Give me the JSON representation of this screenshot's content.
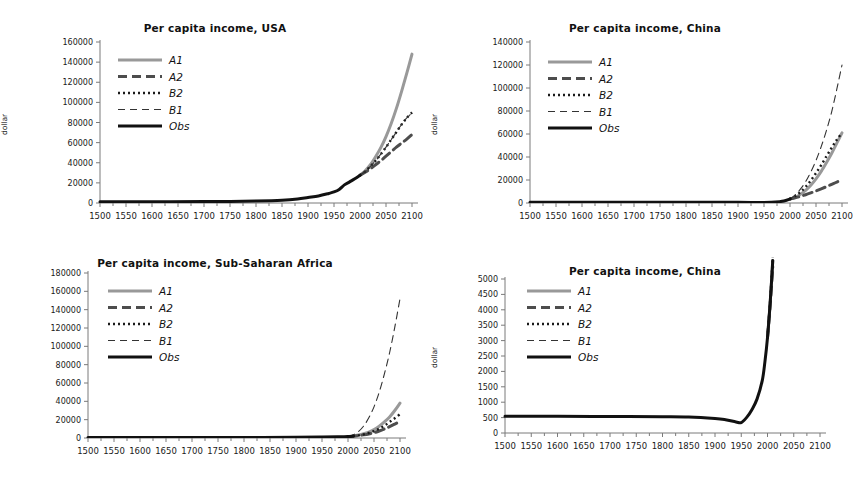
{
  "figure": {
    "panel_count": 4,
    "background_color": "#ffffff",
    "series_colors": {
      "A1": "#999999",
      "A2": "#4d4d4d",
      "B2": "#1a1a1a",
      "B1": "#333333",
      "Obs": "#111111"
    }
  },
  "charts": [
    {
      "id": "usa",
      "title": "Per capita income, USA",
      "ylabel": "dollar",
      "xlabel": "",
      "type": "line",
      "xlim": [
        1500,
        2100
      ],
      "ylim": [
        0,
        160000
      ],
      "xticks": [
        1500,
        1550,
        1600,
        1650,
        1700,
        1750,
        1800,
        1850,
        1900,
        1950,
        2000,
        2050,
        2100
      ],
      "yticks": [
        0,
        20000,
        40000,
        60000,
        80000,
        100000,
        120000,
        140000,
        160000
      ],
      "legend_position": "upper-left",
      "legend": [
        "A1",
        "A2",
        "B2",
        "B1",
        "Obs"
      ],
      "series": [
        {
          "name": "Obs",
          "style": "solid-thick",
          "color": "#111111",
          "x": [
            1500,
            1600,
            1700,
            1750,
            1800,
            1850,
            1880,
            1900,
            1920,
            1940,
            1950,
            1960,
            1970,
            1980,
            1990,
            2000
          ],
          "y": [
            1200,
            1300,
            1400,
            1600,
            2000,
            2800,
            4000,
            5500,
            7000,
            9500,
            11000,
            13500,
            18000,
            21000,
            24000,
            27500
          ]
        },
        {
          "name": "A1",
          "style": "solid-thick-gray",
          "color": "#999999",
          "x": [
            2000,
            2010,
            2020,
            2030,
            2040,
            2050,
            2060,
            2070,
            2080,
            2090,
            2100
          ],
          "y": [
            27500,
            32000,
            38000,
            46000,
            55000,
            66000,
            79000,
            94000,
            111000,
            129000,
            148000
          ]
        },
        {
          "name": "A2",
          "style": "dashed-thick",
          "color": "#4d4d4d",
          "x": [
            2000,
            2010,
            2020,
            2030,
            2040,
            2050,
            2060,
            2070,
            2080,
            2090,
            2100
          ],
          "y": [
            27500,
            30500,
            34000,
            38000,
            42000,
            46500,
            51000,
            55500,
            59500,
            63500,
            68000
          ]
        },
        {
          "name": "B2",
          "style": "dotted",
          "color": "#1a1a1a",
          "x": [
            2000,
            2010,
            2020,
            2030,
            2040,
            2050,
            2060,
            2070,
            2080,
            2090,
            2100
          ],
          "y": [
            27500,
            31500,
            36500,
            42000,
            48500,
            55500,
            63000,
            70500,
            78000,
            84500,
            90000
          ]
        },
        {
          "name": "B1",
          "style": "dashed-thin",
          "color": "#333333",
          "x": [
            2000,
            2010,
            2020,
            2030,
            2040,
            2050,
            2060,
            2070,
            2080,
            2090,
            2100
          ],
          "y": [
            27500,
            31500,
            36500,
            42000,
            48500,
            55500,
            63000,
            70500,
            78000,
            84500,
            89500
          ]
        }
      ]
    },
    {
      "id": "china-top",
      "title": "Per capita income, China",
      "ylabel": "dollar",
      "xlabel": "",
      "type": "line",
      "xlim": [
        1500,
        2100
      ],
      "ylim": [
        0,
        140000
      ],
      "xticks": [
        1500,
        1550,
        1600,
        1650,
        1700,
        1750,
        1800,
        1850,
        1900,
        1950,
        2000,
        2050,
        2100
      ],
      "yticks": [
        0,
        20000,
        40000,
        60000,
        80000,
        100000,
        120000,
        140000
      ],
      "legend_position": "upper-left",
      "legend": [
        "A1",
        "A2",
        "B2",
        "B1",
        "Obs"
      ],
      "series": [
        {
          "name": "Obs",
          "style": "solid-thick",
          "color": "#111111",
          "x": [
            1500,
            1600,
            1700,
            1800,
            1900,
            1950,
            1980,
            1990,
            2000
          ],
          "y": [
            600,
            600,
            600,
            600,
            550,
            450,
            1200,
            2000,
            3500
          ]
        },
        {
          "name": "A1",
          "style": "solid-thick-gray",
          "color": "#999999",
          "x": [
            2000,
            2010,
            2020,
            2030,
            2040,
            2050,
            2060,
            2070,
            2080,
            2090,
            2100
          ],
          "y": [
            3500,
            5000,
            7500,
            11000,
            15500,
            21000,
            27500,
            35000,
            43000,
            52000,
            61000
          ]
        },
        {
          "name": "A2",
          "style": "dashed-thick",
          "color": "#4d4d4d",
          "x": [
            2000,
            2010,
            2020,
            2030,
            2040,
            2050,
            2060,
            2070,
            2080,
            2090,
            2100
          ],
          "y": [
            3500,
            4500,
            5800,
            7200,
            8800,
            10500,
            12300,
            14200,
            16200,
            18200,
            20000
          ]
        },
        {
          "name": "B2",
          "style": "dotted",
          "color": "#1a1a1a",
          "x": [
            2000,
            2010,
            2020,
            2030,
            2040,
            2050,
            2060,
            2070,
            2080,
            2090,
            2100
          ],
          "y": [
            3500,
            6000,
            9500,
            14000,
            19500,
            26000,
            33000,
            40500,
            48000,
            55000,
            61000
          ]
        },
        {
          "name": "B1",
          "style": "dashed-thin",
          "color": "#333333",
          "x": [
            2000,
            2010,
            2020,
            2030,
            2040,
            2050,
            2060,
            2070,
            2080,
            2090,
            2100
          ],
          "y": [
            3500,
            7000,
            12000,
            18500,
            27000,
            37000,
            49000,
            63000,
            79000,
            99000,
            120000
          ]
        }
      ]
    },
    {
      "id": "ssa",
      "title": "Per capita income, Sub-Saharan Africa",
      "ylabel": "dollar",
      "xlabel": "",
      "type": "line",
      "xlim": [
        1500,
        2100
      ],
      "ylim": [
        0,
        180000
      ],
      "xticks": [
        1500,
        1550,
        1600,
        1650,
        1700,
        1750,
        1800,
        1850,
        1900,
        1950,
        2000,
        2050,
        2100
      ],
      "yticks": [
        0,
        20000,
        40000,
        60000,
        80000,
        100000,
        120000,
        140000,
        160000,
        180000
      ],
      "legend_position": "upper-left",
      "legend": [
        "A1",
        "A2",
        "B2",
        "B1",
        "Obs"
      ],
      "series": [
        {
          "name": "Obs",
          "style": "solid-thick",
          "color": "#111111",
          "x": [
            1500,
            1600,
            1700,
            1800,
            1900,
            1950,
            1980,
            2000,
            2010
          ],
          "y": [
            500,
            500,
            500,
            550,
            700,
            1000,
            1300,
            1600,
            2000
          ]
        },
        {
          "name": "A1",
          "style": "solid-thick-gray",
          "color": "#999999",
          "x": [
            2000,
            2010,
            2020,
            2030,
            2040,
            2050,
            2060,
            2070,
            2080,
            2090,
            2100
          ],
          "y": [
            1600,
            2200,
            3200,
            4600,
            6500,
            9200,
            12800,
            17500,
            23000,
            30000,
            38000
          ]
        },
        {
          "name": "A2",
          "style": "dashed-thick",
          "color": "#4d4d4d",
          "x": [
            2000,
            2010,
            2020,
            2030,
            2040,
            2050,
            2060,
            2070,
            2080,
            2090,
            2100
          ],
          "y": [
            1600,
            2000,
            2600,
            3400,
            4400,
            5800,
            7600,
            9800,
            12400,
            15200,
            18000
          ]
        },
        {
          "name": "B2",
          "style": "dotted",
          "color": "#1a1a1a",
          "x": [
            2000,
            2010,
            2020,
            2030,
            2040,
            2050,
            2060,
            2070,
            2080,
            2090,
            2100
          ],
          "y": [
            1600,
            2100,
            2900,
            4000,
            5500,
            7600,
            10200,
            13500,
            17500,
            21500,
            26000
          ]
        },
        {
          "name": "B1",
          "style": "dashed-thin",
          "color": "#333333",
          "x": [
            2000,
            2010,
            2020,
            2030,
            2040,
            2050,
            2060,
            2070,
            2080,
            2090,
            2100
          ],
          "y": [
            1600,
            3500,
            7000,
            13000,
            22000,
            34000,
            50000,
            70000,
            93000,
            121000,
            152000
          ]
        }
      ]
    },
    {
      "id": "china-bottom",
      "title": "Per capita income, China",
      "ylabel": "dollar",
      "xlabel": "",
      "type": "line",
      "xlim": [
        1500,
        2100
      ],
      "ylim": [
        0,
        5000
      ],
      "xticks": [
        1500,
        1550,
        1600,
        1650,
        1700,
        1750,
        1800,
        1850,
        1900,
        1950,
        2000,
        2050,
        2100
      ],
      "yticks": [
        0,
        500,
        1000,
        1500,
        2000,
        2500,
        3000,
        3500,
        4000,
        4500,
        5000
      ],
      "legend_position": "upper-left",
      "legend": [
        "A1",
        "A2",
        "B2",
        "B1",
        "Obs"
      ],
      "series": [
        {
          "name": "Obs",
          "style": "solid-thick",
          "color": "#111111",
          "x": [
            1500,
            1600,
            1700,
            1800,
            1850,
            1900,
            1920,
            1940,
            1950,
            1960,
            1970,
            1980,
            1990,
            1995,
            2000,
            2005,
            2008,
            2010
          ],
          "y": [
            540,
            540,
            535,
            530,
            520,
            470,
            430,
            360,
            340,
            500,
            750,
            1100,
            1700,
            2300,
            3100,
            4200,
            5000,
            5600
          ]
        },
        {
          "name": "A1",
          "style": "solid-thick-gray",
          "color": "#999999",
          "x": [
            2000,
            2005,
            2010
          ],
          "y": [
            3100,
            4200,
            5600
          ]
        },
        {
          "name": "A2",
          "style": "dashed-thick",
          "color": "#4d4d4d",
          "x": [
            2000,
            2005,
            2010
          ],
          "y": [
            3100,
            4150,
            5400
          ]
        },
        {
          "name": "B2",
          "style": "dotted",
          "color": "#1a1a1a",
          "x": [
            2000,
            2005,
            2010
          ],
          "y": [
            3100,
            4250,
            5700
          ]
        },
        {
          "name": "B1",
          "style": "dashed-thin",
          "color": "#333333",
          "x": [
            2000,
            2005,
            2010
          ],
          "y": [
            3100,
            4200,
            5600
          ]
        }
      ]
    }
  ]
}
